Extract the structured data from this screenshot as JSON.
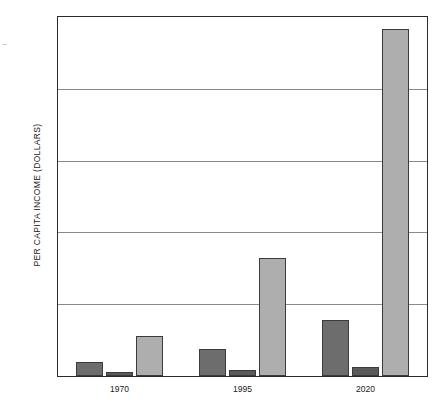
{
  "chart_data": {
    "type": "bar",
    "title": "",
    "xlabel": "",
    "ylabel": "PER CAPITA INCOME (DOLLARS)",
    "categories": [
      "1970",
      "1995",
      "2020"
    ],
    "ylim": [
      0,
      25000
    ],
    "yticks": [
      0,
      5000,
      10000,
      15000,
      20000,
      25000
    ],
    "ytick_labels": [
      "0",
      "5,000",
      "10,000",
      "15,000",
      "20,000",
      "25,000"
    ],
    "grid": true,
    "legend": "none",
    "series": [
      {
        "name": "series-a",
        "color": "#6d6d6d",
        "values": [
          950,
          1900,
          3900
        ]
      },
      {
        "name": "series-b",
        "color": "#5a5a5a",
        "values": [
          300,
          400,
          600
        ]
      },
      {
        "name": "series-c",
        "color": "#aeaeae",
        "values": [
          2800,
          8200,
          24200
        ]
      }
    ]
  },
  "axis": {
    "y_title": "PER CAPITA INCOME (DOLLARS)"
  }
}
